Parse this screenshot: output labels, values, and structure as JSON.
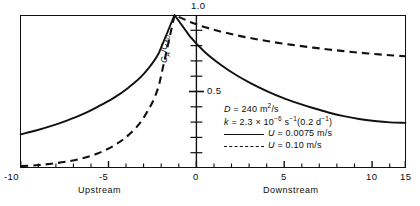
{
  "chart_data": {
    "type": "line",
    "title": "",
    "xlabel": "",
    "ylabel": "C_A/C_A0",
    "ylabel_text": "CA/CA0",
    "xlim": [
      -10,
      15
    ],
    "ylim": [
      0,
      1.0
    ],
    "grid": false,
    "legend_position": "inside-center-right",
    "x_ticks": [
      "-10",
      "-5",
      "0",
      "5",
      "10",
      "15"
    ],
    "x_tick_values": [
      -10,
      -5,
      0,
      5,
      10,
      15
    ],
    "y_ticks": [
      "0.5",
      "1.0"
    ],
    "y_tick_values": [
      0.5,
      1.0
    ],
    "y_minor_tick_values": [
      0.1,
      0.2,
      0.3,
      0.4,
      0.6,
      0.7,
      0.8,
      0.9
    ],
    "region_left": "Upstream",
    "region_right": "Downstream",
    "peak_label": "1.0",
    "series": [
      {
        "name": "U = 0.0075 m/s",
        "style": "solid",
        "x": [
          -10,
          -9,
          -8,
          -7,
          -6,
          -5,
          -4,
          -3,
          -2,
          -1,
          0,
          1,
          2,
          3,
          4,
          5,
          6,
          7,
          8,
          9,
          10,
          11,
          12,
          13,
          14,
          15
        ],
        "y": [
          0.22,
          0.245,
          0.275,
          0.31,
          0.35,
          0.4,
          0.455,
          0.525,
          0.615,
          0.755,
          1.0,
          0.86,
          0.755,
          0.675,
          0.608,
          0.552,
          0.503,
          0.46,
          0.424,
          0.392,
          0.363,
          0.339,
          0.32,
          0.307,
          0.298,
          0.295
        ]
      },
      {
        "name": "U = 0.10 m/s",
        "style": "dashed",
        "x": [
          -10,
          -9,
          -8,
          -7,
          -6,
          -5,
          -4,
          -3,
          -2,
          -1,
          0,
          1,
          2,
          3,
          4,
          5,
          6,
          7,
          8,
          9,
          10,
          11,
          12,
          13,
          14,
          15
        ],
        "y": [
          0.012,
          0.018,
          0.028,
          0.042,
          0.063,
          0.095,
          0.143,
          0.215,
          0.33,
          0.545,
          1.0,
          0.955,
          0.92,
          0.892,
          0.868,
          0.848,
          0.83,
          0.814,
          0.8,
          0.787,
          0.775,
          0.764,
          0.754,
          0.745,
          0.737,
          0.73
        ]
      }
    ],
    "annotations": {
      "line1_sym": "D",
      "line1_eq": "=",
      "line1_val": "240 m",
      "line1_sup": "2",
      "line1_unit": "/s",
      "line2_sym": "k",
      "line2_eq": "=",
      "line2_val": "2.3",
      "line2_times": "×",
      "line2_base": "10",
      "line2_exp": "−6",
      "line2_unit": "s",
      "line2_unit_exp": "−1",
      "line2_paren_open": "(0.2 d",
      "line2_paren_exp": "−1",
      "line2_paren_close": ")",
      "legend1_sym": "U",
      "legend1_eq": "=",
      "legend1_val": "0.0075 m/s",
      "legend2_sym": "U",
      "legend2_eq": "=",
      "legend2_val": "0.10 m/s"
    },
    "colors": {
      "axis": "#111111",
      "curve": "#111111",
      "background": "#ffffff"
    },
    "caption_clipped": ""
  }
}
